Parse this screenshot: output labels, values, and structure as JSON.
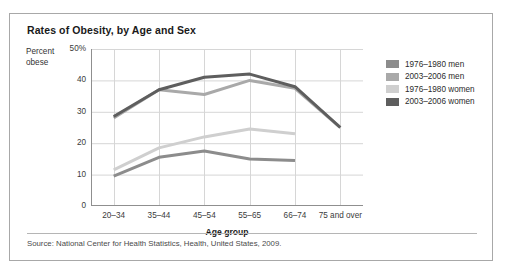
{
  "figure": {
    "title": "Rates of Obesity, by Age and Sex",
    "source": "Source: National Center for Health Statistics, Health, United States, 2009."
  },
  "axes": {
    "ylabel_line1": "Percent",
    "ylabel_line2": "obese",
    "xlabel": "Age group",
    "yticks": [
      "50%",
      "40",
      "30",
      "20",
      "10",
      "0"
    ]
  },
  "legend": {
    "items": [
      {
        "label": "1976–1980 men",
        "color": "#8c8c8c"
      },
      {
        "label": "2003–2006 men",
        "color": "#a9a9a9"
      },
      {
        "label": "1976–1980 women",
        "color": "#cfcfcf"
      },
      {
        "label": "2003–2006 women",
        "color": "#5e5e5e"
      }
    ]
  },
  "chart_data": {
    "type": "line",
    "title": "Rates of Obesity, by Age and Sex",
    "xlabel": "Age group",
    "ylabel": "Percent obese",
    "categories": [
      "20–34",
      "35–44",
      "45–54",
      "55–65",
      "66–74",
      "75 and over"
    ],
    "ylim": [
      0,
      50
    ],
    "yticks": [
      0,
      10,
      20,
      30,
      40,
      50
    ],
    "grid": true,
    "legend_position": "right",
    "series": [
      {
        "name": "1976–1980 men",
        "color": "#8c8c8c",
        "values": [
          9.5,
          15.5,
          17.5,
          15.0,
          14.5,
          null
        ]
      },
      {
        "name": "2003–2006 men",
        "color": "#a9a9a9",
        "values": [
          28.0,
          37.0,
          35.5,
          40.0,
          37.5,
          25.0
        ]
      },
      {
        "name": "1976–1980 women",
        "color": "#cfcfcf",
        "values": [
          11.5,
          18.5,
          22.0,
          24.5,
          23.0,
          null
        ]
      },
      {
        "name": "2003–2006 women",
        "color": "#5e5e5e",
        "values": [
          28.5,
          37.0,
          41.0,
          42.0,
          38.0,
          25.0
        ]
      }
    ]
  }
}
